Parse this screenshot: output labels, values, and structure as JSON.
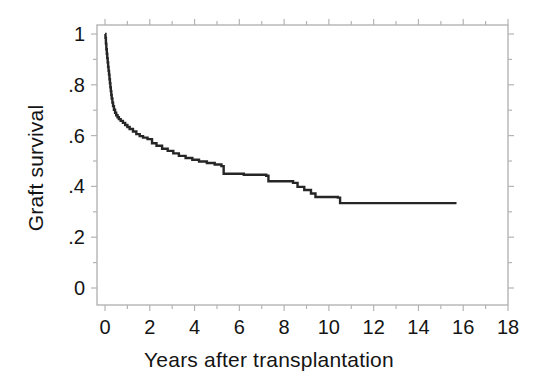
{
  "figure": {
    "background_color": "#ffffff",
    "frame_color": "#b4b4b4",
    "curve_color": "#262626"
  },
  "axis": {
    "x_label": "Years after transplantation",
    "y_label": "Graft survival",
    "x_tick_labels": [
      "0",
      "2",
      "4",
      "6",
      "8",
      "10",
      "12",
      "14",
      "16",
      "18"
    ],
    "y_tick_labels": [
      "1",
      ".8",
      ".6",
      ".4",
      ".2",
      "0"
    ]
  },
  "chart_data": {
    "type": "line",
    "title": "",
    "subtitle": "",
    "xlabel": "Years after transplantation",
    "ylabel": "Graft survival",
    "xlim": [
      0,
      18
    ],
    "ylim": [
      0,
      1
    ],
    "xticks": [
      0,
      2,
      4,
      6,
      8,
      10,
      12,
      14,
      16,
      18
    ],
    "xticks_minor": [
      1,
      3,
      5,
      7,
      9,
      11,
      13,
      15,
      17
    ],
    "yticks": [
      0,
      0.2,
      0.4,
      0.6,
      0.8,
      1
    ],
    "yticks_minor": [
      0.1,
      0.3,
      0.5,
      0.7,
      0.9
    ],
    "grid": false,
    "legend": null,
    "annotations": [],
    "step_style": "post",
    "series": [
      {
        "name": "Graft survival",
        "color": "#262626",
        "x": [
          0.0,
          0.02,
          0.04,
          0.06,
          0.08,
          0.1,
          0.12,
          0.14,
          0.16,
          0.18,
          0.2,
          0.22,
          0.24,
          0.26,
          0.28,
          0.3,
          0.33,
          0.36,
          0.4,
          0.45,
          0.5,
          0.56,
          0.62,
          0.7,
          0.8,
          0.9,
          1.0,
          1.1,
          1.25,
          1.4,
          1.55,
          1.7,
          1.9,
          2.1,
          2.3,
          2.55,
          2.8,
          3.05,
          3.3,
          3.6,
          3.9,
          4.2,
          4.55,
          4.9,
          5.2,
          5.3,
          6.2,
          7.2,
          7.3,
          8.4,
          8.6,
          8.9,
          9.2,
          9.4,
          10.4,
          10.5,
          15.7
        ],
        "y": [
          1.0,
          0.985,
          0.962,
          0.94,
          0.922,
          0.905,
          0.888,
          0.87,
          0.855,
          0.84,
          0.822,
          0.806,
          0.79,
          0.775,
          0.76,
          0.746,
          0.73,
          0.716,
          0.702,
          0.69,
          0.68,
          0.672,
          0.665,
          0.658,
          0.65,
          0.642,
          0.634,
          0.626,
          0.616,
          0.606,
          0.598,
          0.592,
          0.586,
          0.57,
          0.56,
          0.548,
          0.54,
          0.53,
          0.52,
          0.512,
          0.505,
          0.498,
          0.492,
          0.486,
          0.48,
          0.45,
          0.446,
          0.442,
          0.42,
          0.414,
          0.398,
          0.386,
          0.372,
          0.358,
          0.356,
          0.334,
          0.334
        ]
      }
    ]
  }
}
